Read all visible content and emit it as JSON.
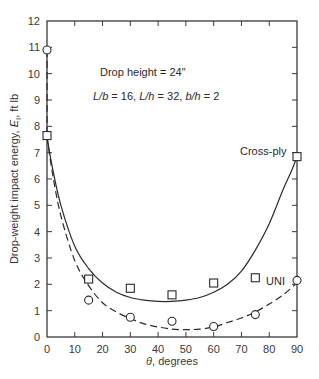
{
  "chart_data": {
    "type": "scatter",
    "title": "",
    "xlabel": "θ, degrees",
    "ylabel": "Drop-weight impact energy, E_I, ft lb",
    "ylabel_parts": {
      "main": "Drop-weight impact energy, ",
      "var": "E",
      "sub": "I",
      "unit": ", ft lb"
    },
    "xlim": [
      0,
      90
    ],
    "ylim": [
      0,
      12
    ],
    "xticks": [
      0,
      10,
      20,
      30,
      40,
      50,
      60,
      70,
      80,
      90
    ],
    "yticks": [
      0,
      1,
      2,
      3,
      4,
      5,
      6,
      7,
      8,
      9,
      10,
      11,
      12
    ],
    "grid": false,
    "annotations": [
      {
        "text": "Drop height = 24\"",
        "x": 28,
        "y": 11
      },
      {
        "text": "L/b = 16, L/h = 32, b/h = 2",
        "x": 26,
        "y": 10.1
      }
    ],
    "series": [
      {
        "name": "Cross-ply",
        "marker": "square",
        "line": "solid",
        "x": [
          0,
          15,
          30,
          45,
          60,
          75,
          90
        ],
        "values": [
          7.65,
          2.2,
          1.85,
          1.6,
          2.05,
          2.25,
          6.85
        ]
      },
      {
        "name": "UNI",
        "marker": "circle",
        "line": "dashed",
        "x": [
          0,
          15,
          30,
          45,
          60,
          75,
          90
        ],
        "values": [
          10.9,
          1.4,
          0.75,
          0.6,
          0.4,
          0.85,
          2.15
        ]
      }
    ],
    "fit_curves": [
      {
        "name": "Cross-ply fit",
        "style": "solid",
        "x": [
          0,
          2,
          5,
          10,
          15,
          20,
          25,
          30,
          35,
          40,
          45,
          50,
          55,
          60,
          65,
          70,
          75,
          80,
          85,
          88,
          90
        ],
        "y": [
          7.6,
          6.4,
          5.0,
          3.45,
          2.6,
          2.05,
          1.7,
          1.5,
          1.4,
          1.35,
          1.35,
          1.4,
          1.5,
          1.7,
          2.0,
          2.5,
          3.3,
          4.3,
          5.6,
          6.3,
          6.85
        ]
      },
      {
        "name": "UNI fit",
        "style": "dashed",
        "x": [
          0,
          2,
          5,
          10,
          15,
          20,
          25,
          30,
          35,
          40,
          45,
          50,
          55,
          60,
          65,
          70,
          75,
          80,
          85,
          90
        ],
        "y": [
          7.6,
          6.2,
          4.6,
          2.9,
          1.95,
          1.3,
          0.95,
          0.7,
          0.5,
          0.38,
          0.3,
          0.28,
          0.3,
          0.38,
          0.55,
          0.72,
          0.95,
          1.25,
          1.6,
          2.05
        ]
      }
    ],
    "legend": {
      "position": "inline",
      "entries": [
        "Cross-ply",
        "UNI"
      ]
    }
  }
}
